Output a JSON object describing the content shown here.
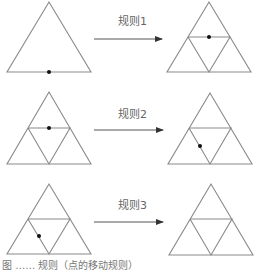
{
  "colors": {
    "edge": "#8a8a8a",
    "arrow": "#555555",
    "dot": "#111111",
    "label": "#666666"
  },
  "rows": [
    {
      "rule_label": "规则1",
      "before": {
        "subdivided": false,
        "dot": [
          49,
          72
        ]
      },
      "after": {
        "subdivided": true,
        "dot": [
          209,
          37
        ]
      }
    },
    {
      "rule_label": "规则2",
      "before": {
        "subdivided": true,
        "dot": [
          49,
          128
        ]
      },
      "after": {
        "subdivided": true,
        "dot": [
          200,
          146
        ]
      }
    },
    {
      "rule_label": "规则3",
      "before": {
        "subdivided": true,
        "dot": [
          39,
          236
        ]
      },
      "after": {
        "subdivided": true,
        "dot": null
      }
    }
  ],
  "caption": "图 …… 规则（点的移动规则）"
}
